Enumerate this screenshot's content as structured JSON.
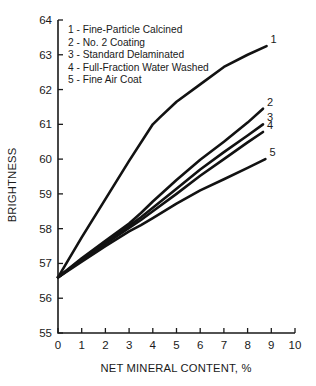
{
  "chart_data": {
    "type": "line",
    "title": "",
    "xlabel": "NET MINERAL CONTENT, %",
    "ylabel": "BRIGHTNESS",
    "xlim": [
      0,
      10
    ],
    "ylim": [
      55,
      64
    ],
    "xticks": [
      "0",
      "1",
      "2",
      "3",
      "4",
      "5",
      "6",
      "7",
      "8",
      "9",
      "10"
    ],
    "yticks": [
      "55",
      "56",
      "57",
      "58",
      "59",
      "60",
      "61",
      "62",
      "63",
      "64"
    ],
    "grid": false,
    "legend_position": "upper-left-inside",
    "line_color": "#121212",
    "axis_color": "#1a1a1a",
    "series": [
      {
        "key": "1",
        "name": "Fine-Particle Calcined",
        "legend_entry": "1 - Fine-Particle Calcined",
        "end_label": "1",
        "x": [
          0,
          1,
          2,
          3,
          4,
          4.3,
          5,
          6,
          7,
          8,
          8.8
        ],
        "y": [
          56.6,
          57.75,
          58.85,
          59.95,
          61.0,
          61.2,
          61.65,
          62.15,
          62.65,
          63.0,
          63.25
        ]
      },
      {
        "key": "2",
        "name": "No. 2 Coating",
        "legend_entry": "2 - No. 2 Coating",
        "end_label": "2",
        "x": [
          0,
          1,
          2,
          3,
          3.5,
          4,
          5,
          6,
          7,
          8,
          8.65
        ],
        "y": [
          56.6,
          57.15,
          57.65,
          58.15,
          58.45,
          58.78,
          59.4,
          59.98,
          60.5,
          61.05,
          61.45
        ]
      },
      {
        "key": "3",
        "name": "Standard Delaminated",
        "legend_entry": "3 - Standard Delaminated",
        "end_label": "3",
        "x": [
          0,
          1,
          2,
          3,
          3.5,
          4,
          5,
          6,
          7,
          8,
          8.65
        ],
        "y": [
          56.6,
          57.12,
          57.6,
          58.08,
          58.33,
          58.6,
          59.15,
          59.7,
          60.2,
          60.68,
          61.0
        ]
      },
      {
        "key": "4",
        "name": "Full-Fraction Water Washed",
        "legend_entry": "4 - Full-Fraction Water Washed",
        "end_label": "4",
        "x": [
          0,
          1,
          2,
          3,
          3.5,
          4,
          5,
          6,
          7,
          8,
          8.65
        ],
        "y": [
          56.6,
          57.1,
          57.56,
          58.02,
          58.25,
          58.5,
          59.0,
          59.52,
          60.0,
          60.48,
          60.78
        ]
      },
      {
        "key": "5",
        "name": "Fine Air Coat",
        "legend_entry": "5 - Fine Air Coat",
        "end_label": "5",
        "x": [
          0,
          1,
          2,
          3,
          3.5,
          4,
          5,
          6,
          7,
          8,
          8.75
        ],
        "y": [
          56.6,
          57.05,
          57.5,
          57.92,
          58.1,
          58.3,
          58.72,
          59.1,
          59.42,
          59.75,
          60.0
        ]
      }
    ]
  },
  "legend": {
    "lines": [
      "1 - Fine-Particle Calcined",
      "2 - No. 2 Coating",
      "3 - Standard Delaminated",
      "4 - Full-Fraction Water Washed",
      "5 - Fine Air Coat"
    ]
  }
}
